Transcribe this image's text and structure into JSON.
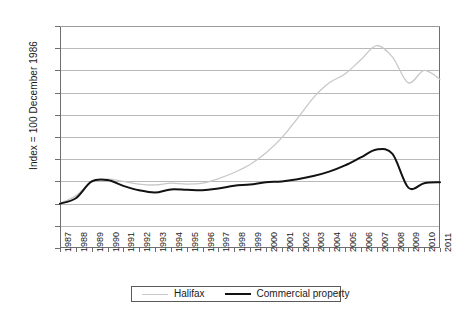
{
  "chart_data": {
    "type": "line",
    "title": "",
    "xlabel": "",
    "ylabel": "Index = 100 December 1986",
    "ylim": [
      0,
      500
    ],
    "ytick_step": 50,
    "yticks": [
      0,
      50,
      100,
      150,
      200,
      250,
      300,
      350,
      400,
      450,
      500
    ],
    "grid": true,
    "legend_position": "bottom",
    "categories": [
      "1987",
      "1988",
      "1989",
      "1990",
      "1991",
      "1992",
      "1993",
      "1994",
      "1995",
      "1996",
      "1997",
      "1998",
      "1999",
      "2000",
      "2001",
      "2002",
      "2003",
      "2004",
      "2005",
      "2006",
      "2007",
      "2008",
      "2009",
      "2010",
      "2011"
    ],
    "series": [
      {
        "name": "Halifax",
        "color": "#c8c8c8",
        "values": [
          100,
          118,
          148,
          155,
          150,
          144,
          142,
          146,
          144,
          146,
          156,
          170,
          188,
          214,
          248,
          292,
          338,
          372,
          392,
          424,
          456,
          430,
          372,
          400,
          380
        ]
      },
      {
        "name": "Commercial property",
        "color": "#121212",
        "values": [
          100,
          112,
          150,
          153,
          140,
          130,
          125,
          132,
          131,
          130,
          134,
          140,
          143,
          148,
          150,
          155,
          162,
          172,
          186,
          204,
          222,
          212,
          136,
          146,
          148
        ]
      }
    ]
  },
  "legend": {
    "items": [
      {
        "label": "Halifax",
        "marker": "halifax-line-swatch"
      },
      {
        "label": "Commercial property",
        "marker": "commercial-line-swatch"
      }
    ]
  }
}
